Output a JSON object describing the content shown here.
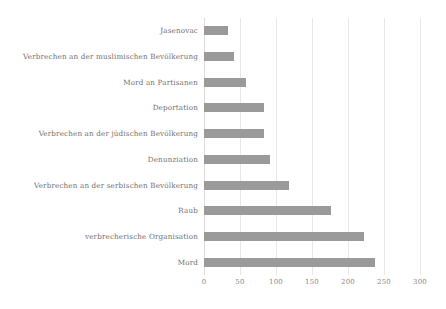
{
  "chart_data": {
    "type": "bar",
    "orientation": "horizontal",
    "title": "",
    "subtitle": "",
    "xlabel": "",
    "ylabel": "",
    "xlim": [
      0,
      300
    ],
    "ylim": null,
    "grid": true,
    "legend": null,
    "legend_position": "none",
    "bar_color": "#9a9a9a",
    "tick_label_color": "#8a8a8a",
    "category_label_color": "#6f6f6f",
    "xticks": [
      "0",
      "50",
      "100",
      "150",
      "200",
      "250",
      "300"
    ],
    "xtick_values": [
      0,
      50,
      100,
      150,
      200,
      250,
      300
    ],
    "categories": [
      "Jasenovac",
      "Verbrechen an der muslimischen Bevölkerung",
      "Mord an Partisanen",
      "Deportation",
      "Verbrechen an der jüdischen Bevölkerung",
      "Denunziation",
      "Verbrechen an der serbischen Bevölkerung",
      "Raub",
      "verbrecherische Organisation",
      "Mord"
    ],
    "values": [
      33,
      42,
      58,
      83,
      83,
      92,
      118,
      176,
      222,
      238
    ]
  }
}
